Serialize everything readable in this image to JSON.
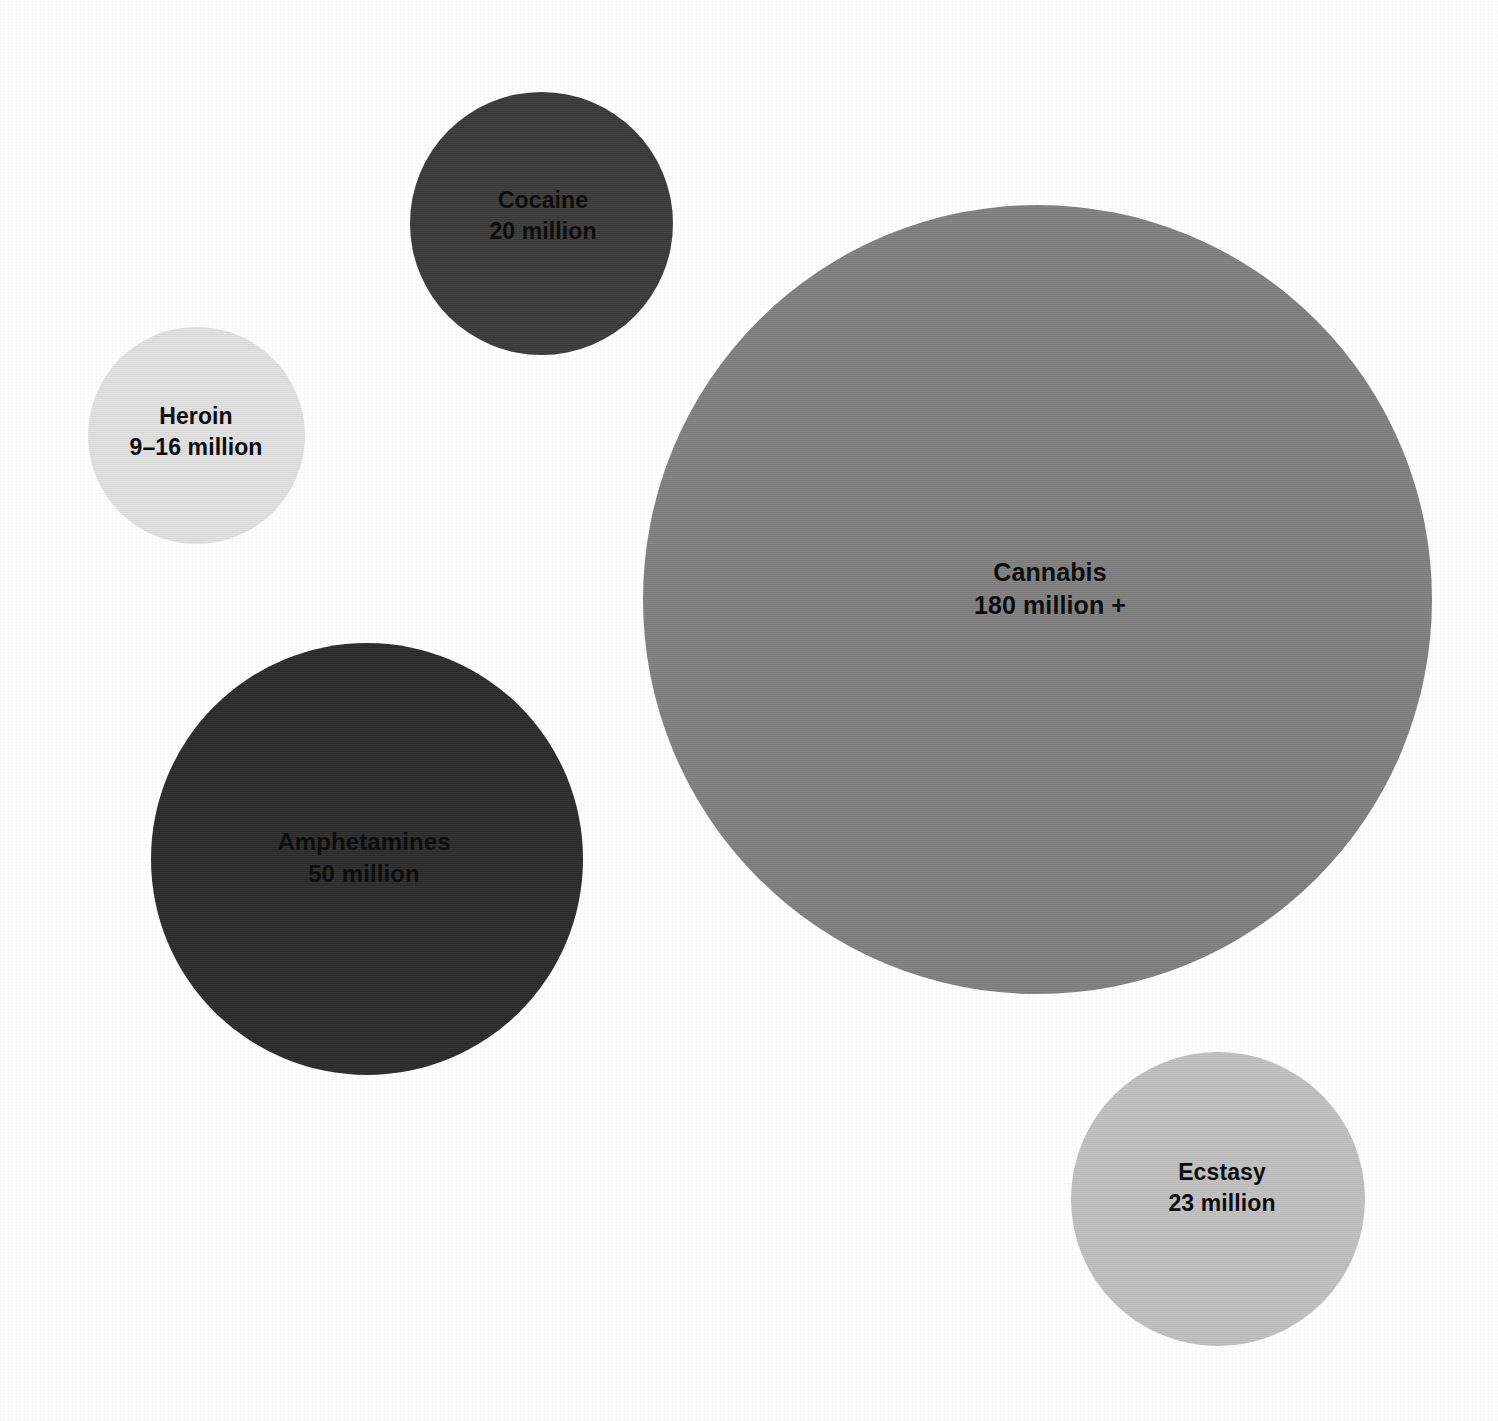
{
  "chart_data": {
    "type": "bubble",
    "title": "",
    "subtitle": "",
    "xlabel": "",
    "ylabel": "",
    "unit": "million people",
    "grid": false,
    "legend_position": "none",
    "note": "Area-proportional bubbles; label sits inside each bubble.",
    "categories": [
      "Heroin",
      "Cocaine",
      "Cannabis",
      "Amphetamines",
      "Ecstasy"
    ],
    "values": [
      12.5,
      20,
      180,
      50,
      23
    ],
    "bubbles": [
      {
        "id": "heroin",
        "name": "Heroin",
        "value_label": "9–16 million",
        "value": 12.5,
        "value_min": 9,
        "value_max": 16,
        "color": "#e1e1e1",
        "cx": 196,
        "cy": 435,
        "diameter": 217,
        "label_cx": 196,
        "label_cy": 432,
        "font_size": 23
      },
      {
        "id": "cocaine",
        "name": "Cocaine",
        "value_label": "20 million",
        "value": 20,
        "color": "#3a3a3a",
        "cx": 541,
        "cy": 223,
        "diameter": 263,
        "label_cx": 543,
        "label_cy": 216,
        "font_size": 23
      },
      {
        "id": "cannabis",
        "name": "Cannabis",
        "value_label": "180 million +",
        "value": 180,
        "color": "#808080",
        "cx": 1037,
        "cy": 599,
        "diameter": 789,
        "label_cx": 1050,
        "label_cy": 589,
        "font_size": 25
      },
      {
        "id": "amphetamines",
        "name": "Amphetamines",
        "value_label": "50 million",
        "value": 50,
        "color": "#2b2b2b",
        "cx": 367,
        "cy": 859,
        "diameter": 432,
        "label_cx": 364,
        "label_cy": 858,
        "font_size": 24
      },
      {
        "id": "ecstasy",
        "name": "Ecstasy",
        "value_label": "23 million",
        "value": 23,
        "color": "#c0c0c0",
        "cx": 1218,
        "cy": 1199,
        "diameter": 294,
        "label_cx": 1222,
        "label_cy": 1188,
        "font_size": 23
      }
    ]
  },
  "canvas": {
    "background": "#fdfdfd",
    "width": 1498,
    "height": 1421
  }
}
